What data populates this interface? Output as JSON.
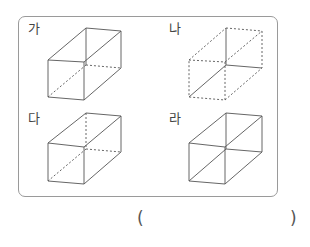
{
  "figures": [
    {
      "label": "가",
      "id": "ga",
      "label_pos": [
        28,
        22
      ],
      "origin": [
        48,
        28
      ],
      "style": "standard-dashed-hidden"
    },
    {
      "label": "나",
      "id": "na",
      "label_pos": [
        169,
        22
      ],
      "origin": [
        189,
        28
      ],
      "style": "inverted"
    },
    {
      "label": "다",
      "id": "da",
      "label_pos": [
        28,
        112
      ],
      "origin": [
        48,
        118
      ],
      "style": "standard-dashed-hidden"
    },
    {
      "label": "라",
      "id": "ra",
      "label_pos": [
        169,
        112
      ],
      "origin": [
        189,
        118
      ],
      "style": "all-solid"
    }
  ],
  "answer": {
    "open_paren": "(",
    "close_paren": ")",
    "value": ""
  },
  "colors": {
    "frame_border": "#9a9a9a",
    "edge": "#555555"
  }
}
